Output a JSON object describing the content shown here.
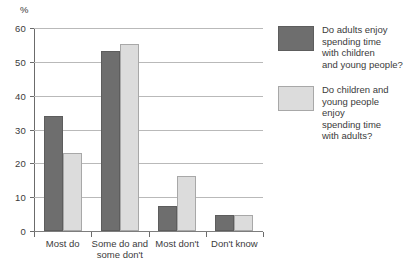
{
  "chart_data": {
    "type": "bar",
    "title": "",
    "xlabel": "",
    "ylabel": "%",
    "ylim": [
      0,
      60
    ],
    "ytick_step": 10,
    "yticks": [
      0,
      10,
      20,
      30,
      40,
      50,
      60
    ],
    "ytick_labels": [
      "0",
      "10",
      "20",
      "30",
      "40",
      "50",
      "60"
    ],
    "grid": true,
    "legend_position": "right",
    "categories": [
      "Most do",
      "Some do and\nsome don't",
      "Most don't",
      "Don't know"
    ],
    "series": [
      {
        "name": "Do adults enjoy\nspending time\nwith children\nand young people?",
        "color": "#6e6e6e",
        "values": [
          34.0,
          53.3,
          7.5,
          4.8
        ]
      },
      {
        "name": "Do children and\nyoung people enjoy\nspending time\nwith adults?",
        "color": "#dcdcdc",
        "values": [
          23.2,
          55.4,
          16.3,
          4.6
        ]
      }
    ]
  },
  "axis": {
    "percent_symbol": "%"
  },
  "colors": {
    "series_dark": "#6e6e6e",
    "series_light": "#dcdcdc",
    "gridline": "#b9b9b9",
    "axis": "#6b6b6b",
    "text": "#3b3b3b"
  }
}
